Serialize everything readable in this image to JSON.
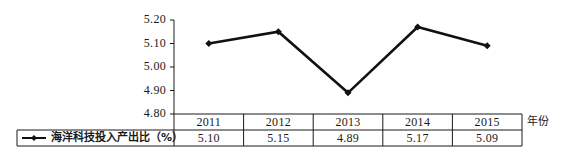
{
  "chart_data": {
    "type": "line",
    "title": "",
    "xlabel": "年份",
    "ylabel": "",
    "categories": [
      "2011",
      "2012",
      "2013",
      "2014",
      "2015"
    ],
    "series": [
      {
        "name": "海洋科技投入产出比（%）",
        "values": [
          5.1,
          5.15,
          4.89,
          5.17,
          5.09
        ],
        "marker": "diamond",
        "color": "#111111"
      }
    ],
    "yticks": [
      "5.20",
      "5.10",
      "5.00",
      "4.90",
      "4.80"
    ],
    "ylim": [
      4.8,
      5.2
    ],
    "grid": false,
    "legend_position": "data-table-left",
    "data_table": {
      "header": [
        "2011",
        "2012",
        "2013",
        "2014",
        "2015"
      ],
      "row_label": "海洋科技投入产出比（%）",
      "row_values": [
        "5.10",
        "5.15",
        "4.89",
        "5.17",
        "5.09"
      ]
    }
  }
}
